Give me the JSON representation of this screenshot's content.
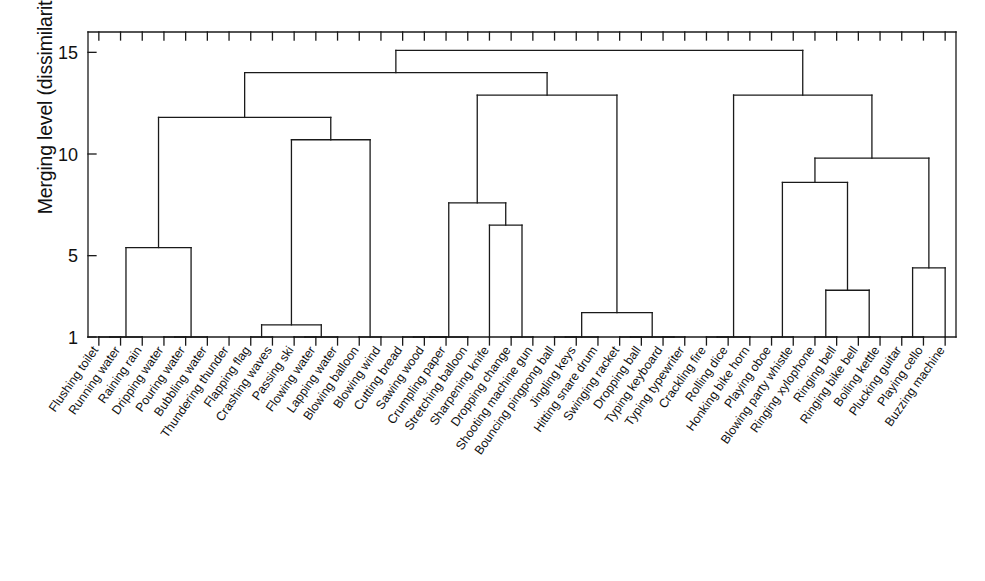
{
  "chart_data": {
    "type": "dendrogram",
    "title": "",
    "xlabel": "",
    "ylabel": "Merging level (dissimilarity)",
    "ylim": [
      1,
      16
    ],
    "ytick_values": [
      1,
      5,
      10,
      15
    ],
    "ytick_labels": [
      "1",
      "5",
      "10",
      "15"
    ],
    "grid": false,
    "legend": null,
    "baseline": 1,
    "leaf_labels": [
      "Flushing toilet",
      "Running water",
      "Raining rain",
      "Dripping water",
      "Pouring water",
      "Bubbling water",
      "Thundering thunder",
      "Flapping flag",
      "Crashing waves",
      "Passing ski",
      "Flowing water",
      "Lapping water",
      "Blowing balloon",
      "Blowing wind",
      "Cutting bread",
      "Sawing wood",
      "Crumpling paper",
      "Stretching balloon",
      "Sharpening knife",
      "Dropping change",
      "Shooting machine gun",
      "Bouncing pingpong ball",
      "Jingling keys",
      "Hitting snare drum",
      "Swinging racket",
      "Dropping ball",
      "Typing keyboard",
      "Typing typewriter",
      "Crackling fire",
      "Rolling dice",
      "Honking bike horn",
      "Playing oboe",
      "Blowing party whistle",
      "Ringing xylophone",
      "Ringing bell",
      "Ringing bike bell",
      "Boiling kettle",
      "Plucking guitar",
      "Playing cello",
      "Buzzing machine"
    ],
    "merges": [
      {
        "id": "m_water1",
        "left": {
          "leaf": 0
        },
        "right": {
          "leaf": 1
        },
        "height": 1.0
      },
      {
        "id": "m_water2",
        "left": {
          "node": "m_water1"
        },
        "right": {
          "leaf": 2
        },
        "height": 1.0
      },
      {
        "id": "m_water3",
        "left": {
          "leaf": 3
        },
        "right": {
          "leaf": 4
        },
        "height": 1.0
      },
      {
        "id": "m_water4",
        "left": {
          "node": "m_water3"
        },
        "right": {
          "leaf": 5
        },
        "height": 1.0
      },
      {
        "id": "m_waterA",
        "left": {
          "node": "m_water2"
        },
        "right": {
          "node": "m_water4"
        },
        "height": 5.4
      },
      {
        "id": "m_flag1",
        "left": {
          "leaf": 7
        },
        "right": {
          "leaf": 8
        },
        "height": 1.0
      },
      {
        "id": "m_ski1",
        "left": {
          "leaf": 9
        },
        "right": {
          "leaf": 10
        },
        "height": 1.0
      },
      {
        "id": "m_ski2",
        "left": {
          "node": "m_ski1"
        },
        "right": {
          "leaf": 11
        },
        "height": 1.0
      },
      {
        "id": "m_wave",
        "left": {
          "node": "m_flag1"
        },
        "right": {
          "node": "m_ski2"
        },
        "height": 1.6
      },
      {
        "id": "m_blowB",
        "left": {
          "leaf": 12
        },
        "right": {
          "leaf": 13
        },
        "height": 1.0
      },
      {
        "id": "m_airA",
        "left": {
          "node": "m_wave"
        },
        "right": {
          "node": "m_blowB"
        },
        "height": 10.7
      },
      {
        "id": "m_natureA",
        "left": {
          "node": "m_waterA"
        },
        "right": {
          "node": "m_airA"
        },
        "height": 11.8
      },
      {
        "id": "m_cut1",
        "left": {
          "leaf": 14
        },
        "right": {
          "leaf": 15
        },
        "height": 1.0
      },
      {
        "id": "m_cut2",
        "left": {
          "node": "m_cut1"
        },
        "right": {
          "leaf": 16
        },
        "height": 1.0
      },
      {
        "id": "m_cut3",
        "left": {
          "node": "m_cut2"
        },
        "right": {
          "leaf": 17
        },
        "height": 1.0
      },
      {
        "id": "m_knife",
        "left": {
          "leaf": 19
        },
        "right": {
          "leaf": 20
        },
        "height": 1.0
      },
      {
        "id": "m_knife2",
        "left": {
          "leaf": 18
        },
        "right": {
          "node": "m_knife"
        },
        "height": 6.5
      },
      {
        "id": "m_toolA",
        "left": {
          "node": "m_cut3"
        },
        "right": {
          "node": "m_knife2"
        },
        "height": 7.6
      },
      {
        "id": "m_ball1",
        "left": {
          "leaf": 21
        },
        "right": {
          "leaf": 22
        },
        "height": 1.0
      },
      {
        "id": "m_ball2",
        "left": {
          "node": "m_ball1"
        },
        "right": {
          "leaf": 23
        },
        "height": 1.0
      },
      {
        "id": "m_rack1",
        "left": {
          "leaf": 24
        },
        "right": {
          "leaf": 25
        },
        "height": 1.0
      },
      {
        "id": "m_type1",
        "left": {
          "leaf": 26
        },
        "right": {
          "leaf": 27
        },
        "height": 1.0
      },
      {
        "id": "m_type2",
        "left": {
          "node": "m_rack1"
        },
        "right": {
          "node": "m_type1"
        },
        "height": 1.0
      },
      {
        "id": "m_impact",
        "left": {
          "node": "m_ball2"
        },
        "right": {
          "node": "m_type2"
        },
        "height": 2.2
      },
      {
        "id": "m_mechA",
        "left": {
          "node": "m_toolA"
        },
        "right": {
          "node": "m_impact"
        },
        "height": 12.9
      },
      {
        "id": "m_mid",
        "left": {
          "node": "m_natureA"
        },
        "right": {
          "node": "m_mechA"
        },
        "height": 14.0
      },
      {
        "id": "m_fire1",
        "left": {
          "leaf": 28
        },
        "right": {
          "leaf": 29
        },
        "height": 1.0
      },
      {
        "id": "m_fire2",
        "left": {
          "node": "m_fire1"
        },
        "right": {
          "leaf": 30
        },
        "height": 1.0
      },
      {
        "id": "m_oboe1",
        "left": {
          "leaf": 31
        },
        "right": {
          "leaf": 32
        },
        "height": 1.0
      },
      {
        "id": "m_bell1",
        "left": {
          "leaf": 33
        },
        "right": {
          "leaf": 34
        },
        "height": 1.0
      },
      {
        "id": "m_bell2",
        "left": {
          "leaf": 35
        },
        "right": {
          "leaf": 36
        },
        "height": 1.0
      },
      {
        "id": "m_bellA",
        "left": {
          "node": "m_bell1"
        },
        "right": {
          "node": "m_bell2"
        },
        "height": 3.3
      },
      {
        "id": "m_musicA",
        "left": {
          "node": "m_oboe1"
        },
        "right": {
          "node": "m_bellA"
        },
        "height": 8.6
      },
      {
        "id": "m_str1",
        "left": {
          "leaf": 37
        },
        "right": {
          "leaf": 38
        },
        "height": 1.0
      },
      {
        "id": "m_str2",
        "left": {
          "node": "m_str1"
        },
        "right": {
          "leaf": 39
        },
        "height": 4.4
      },
      {
        "id": "m_musicB",
        "left": {
          "node": "m_musicA"
        },
        "right": {
          "node": "m_str2"
        },
        "height": 9.8
      },
      {
        "id": "m_right",
        "left": {
          "node": "m_fire2"
        },
        "right": {
          "node": "m_musicB"
        },
        "height": 12.9
      },
      {
        "id": "m_root",
        "left": {
          "node": "m_mid"
        },
        "right": {
          "node": "m_right"
        },
        "height": 15.1
      }
    ],
    "colors": {
      "line": "#1a1a1a",
      "axis": "#1a1a1a",
      "background": "#ffffff"
    }
  }
}
